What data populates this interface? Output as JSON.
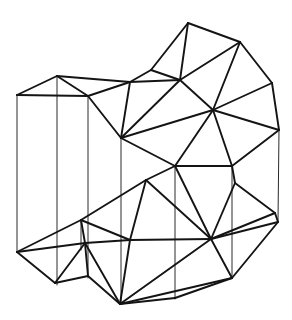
{
  "figure": {
    "type": "wireframe-mesh",
    "background_color": "#ffffff",
    "edge_color": "#141414",
    "hidden_edge_color": "#2a2a2a",
    "edge_width": 1.9,
    "hidden_edge_width": 1.0,
    "canvas": {
      "width": 292,
      "height": 320
    }
  },
  "chart_data": {
    "type": "diagram",
    "xlabel": "",
    "ylabel": "",
    "grid": false,
    "legend": "none",
    "xlim": [
      0,
      292
    ],
    "ylim": [
      0,
      320
    ],
    "vertices": [
      {
        "id": "v0",
        "x": 17,
        "y": 95
      },
      {
        "id": "v1",
        "x": 57,
        "y": 76
      },
      {
        "id": "v2",
        "x": 88,
        "y": 96
      },
      {
        "id": "v3",
        "x": 121,
        "y": 138
      },
      {
        "id": "v4",
        "x": 130,
        "y": 82
      },
      {
        "id": "v5",
        "x": 151,
        "y": 70
      },
      {
        "id": "v6",
        "x": 180,
        "y": 80
      },
      {
        "id": "v7",
        "x": 188,
        "y": 23
      },
      {
        "id": "v8",
        "x": 240,
        "y": 42
      },
      {
        "id": "v9",
        "x": 213,
        "y": 110
      },
      {
        "id": "v10",
        "x": 272,
        "y": 83
      },
      {
        "id": "v11",
        "x": 279,
        "y": 130
      },
      {
        "id": "v12",
        "x": 175,
        "y": 166
      },
      {
        "id": "v13",
        "x": 232,
        "y": 166
      },
      {
        "id": "v14",
        "x": 17,
        "y": 252
      },
      {
        "id": "v15",
        "x": 55,
        "y": 283
      },
      {
        "id": "v16",
        "x": 120,
        "y": 304
      },
      {
        "id": "v17",
        "x": 81,
        "y": 220
      },
      {
        "id": "v18",
        "x": 85,
        "y": 243
      },
      {
        "id": "v19",
        "x": 130,
        "y": 240
      },
      {
        "id": "v20",
        "x": 146,
        "y": 180
      },
      {
        "id": "v21",
        "x": 211,
        "y": 239
      },
      {
        "id": "v22",
        "x": 232,
        "y": 278
      },
      {
        "id": "v23",
        "x": 235,
        "y": 183
      },
      {
        "id": "v24",
        "x": 275,
        "y": 213
      },
      {
        "id": "v25",
        "x": 278,
        "y": 222
      },
      {
        "id": "v26",
        "x": 88,
        "y": 276
      },
      {
        "id": "v27",
        "x": 175,
        "y": 298
      }
    ],
    "upper_surface_edges": [
      [
        "v0",
        "v1"
      ],
      [
        "v1",
        "v2"
      ],
      [
        "v0",
        "v2"
      ],
      [
        "v1",
        "v4"
      ],
      [
        "v2",
        "v4"
      ],
      [
        "v2",
        "v3"
      ],
      [
        "v3",
        "v4"
      ],
      [
        "v4",
        "v5"
      ],
      [
        "v5",
        "v6"
      ],
      [
        "v4",
        "v6"
      ],
      [
        "v3",
        "v6"
      ],
      [
        "v5",
        "v7"
      ],
      [
        "v6",
        "v7"
      ],
      [
        "v7",
        "v8"
      ],
      [
        "v6",
        "v8"
      ],
      [
        "v6",
        "v9"
      ],
      [
        "v8",
        "v9"
      ],
      [
        "v8",
        "v10"
      ],
      [
        "v9",
        "v10"
      ],
      [
        "v10",
        "v11"
      ],
      [
        "v9",
        "v11"
      ],
      [
        "v3",
        "v9"
      ],
      [
        "v3",
        "v12"
      ],
      [
        "v9",
        "v12"
      ],
      [
        "v9",
        "v13"
      ],
      [
        "v12",
        "v13"
      ],
      [
        "v11",
        "v13"
      ]
    ],
    "lower_surface_edges": [
      [
        "v14",
        "v17"
      ],
      [
        "v14",
        "v18"
      ],
      [
        "v14",
        "v15"
      ],
      [
        "v17",
        "v18"
      ],
      [
        "v17",
        "v20"
      ],
      [
        "v18",
        "v19"
      ],
      [
        "v17",
        "v19"
      ],
      [
        "v19",
        "v20"
      ],
      [
        "v20",
        "v12"
      ],
      [
        "v19",
        "v21"
      ],
      [
        "v20",
        "v21"
      ],
      [
        "v12",
        "v21"
      ],
      [
        "v21",
        "v23"
      ],
      [
        "v23",
        "v13"
      ],
      [
        "v23",
        "v24"
      ],
      [
        "v21",
        "v24"
      ],
      [
        "v24",
        "v25"
      ],
      [
        "v21",
        "v25"
      ],
      [
        "v21",
        "v22"
      ],
      [
        "v22",
        "v25"
      ],
      [
        "v15",
        "v18"
      ],
      [
        "v15",
        "v26"
      ],
      [
        "v18",
        "v26"
      ],
      [
        "v26",
        "v16"
      ],
      [
        "v19",
        "v16"
      ],
      [
        "v18",
        "v16"
      ],
      [
        "v16",
        "v21"
      ],
      [
        "v16",
        "v27"
      ],
      [
        "v27",
        "v22"
      ],
      [
        "v16",
        "v22"
      ]
    ],
    "vertical_edges": [
      [
        "v0",
        "v14"
      ],
      [
        "v1",
        "v15"
      ],
      [
        "v2",
        "v26"
      ],
      [
        "v3",
        "v16"
      ],
      [
        "v12",
        "v27"
      ],
      [
        "v13",
        "v22"
      ],
      [
        "v17",
        "v17b"
      ],
      [
        "v11",
        "v25"
      ]
    ],
    "annotations": []
  }
}
